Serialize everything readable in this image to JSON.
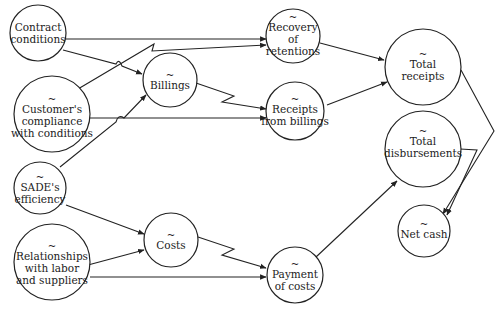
{
  "diagram": {
    "type": "causal-influence-diagram",
    "nodes": [
      {
        "id": "contract",
        "tilde": false,
        "lines": [
          "Contract",
          "conditions"
        ]
      },
      {
        "id": "compliance",
        "tilde": true,
        "lines": [
          "Customer's",
          "compliance",
          "with conditions"
        ]
      },
      {
        "id": "sade",
        "tilde": true,
        "lines": [
          "SADE's",
          "efficiency"
        ]
      },
      {
        "id": "relationships",
        "tilde": true,
        "lines": [
          "Relationships",
          "with labor",
          "and suppliers"
        ]
      },
      {
        "id": "billings",
        "tilde": true,
        "lines": [
          "Billings"
        ]
      },
      {
        "id": "costs",
        "tilde": true,
        "lines": [
          "Costs"
        ]
      },
      {
        "id": "recovery",
        "tilde": true,
        "lines": [
          "Recovery",
          "of",
          "retentions"
        ]
      },
      {
        "id": "receipts",
        "tilde": true,
        "lines": [
          "Receipts",
          "from billings"
        ]
      },
      {
        "id": "payment",
        "tilde": true,
        "lines": [
          "Payment",
          "of costs"
        ]
      },
      {
        "id": "total_receipts",
        "tilde": true,
        "lines": [
          "Total",
          "receipts"
        ]
      },
      {
        "id": "total_disb",
        "tilde": true,
        "lines": [
          "Total",
          "disbursements"
        ]
      },
      {
        "id": "net_cash",
        "tilde": true,
        "lines": [
          "Net cash"
        ]
      }
    ],
    "edges": [
      {
        "from": "Contract conditions",
        "to": "Recovery of retentions"
      },
      {
        "from": "Contract conditions",
        "to": "Billings"
      },
      {
        "from": "Customer's compliance with conditions",
        "to": "Recovery of retentions"
      },
      {
        "from": "Customer's compliance with conditions",
        "to": "Receipts from billings"
      },
      {
        "from": "SADE's efficiency",
        "to": "Billings"
      },
      {
        "from": "SADE's efficiency",
        "to": "Costs"
      },
      {
        "from": "Relationships with labor and suppliers",
        "to": "Costs"
      },
      {
        "from": "Relationships with labor and suppliers",
        "to": "Payment of costs"
      },
      {
        "from": "Billings",
        "to": "Receipts from billings",
        "delayed": true
      },
      {
        "from": "Costs",
        "to": "Payment of costs",
        "delayed": true
      },
      {
        "from": "Recovery of retentions",
        "to": "Total receipts"
      },
      {
        "from": "Receipts from billings",
        "to": "Total receipts"
      },
      {
        "from": "Payment of costs",
        "to": "Total disbursements"
      },
      {
        "from": "Total receipts",
        "to": "Net cash"
      },
      {
        "from": "Total disbursements",
        "to": "Net cash"
      }
    ],
    "tilde_symbol": "~"
  }
}
